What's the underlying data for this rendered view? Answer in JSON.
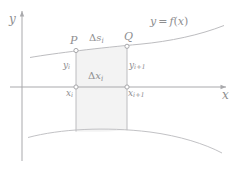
{
  "figure": {
    "background_color": "#ffffff",
    "line_color": "#b9b9bc",
    "axis_color": "#a8a8ab",
    "text_color": "#8e8e90",
    "fill_color": "#f2f2f2"
  },
  "axes": {
    "y_label": "y",
    "x_label": "x",
    "x_axis_y": 87,
    "y_axis_x": 22,
    "x_axis_start": 10,
    "x_axis_end": 228,
    "y_axis_start": 10,
    "y_axis_end": 161
  },
  "curve": {
    "function_label": "y = f(x)",
    "type": "increasing-concave-up"
  },
  "lower_curve": {
    "type": "arc-concave-down"
  },
  "points": [
    {
      "name": "P",
      "label": "P",
      "x": 76,
      "y": 50
    },
    {
      "name": "Q",
      "label": "Q",
      "x": 127,
      "y": 46
    },
    {
      "name": "x_i-axis-point",
      "label": "",
      "x": 76,
      "y": 87
    },
    {
      "name": "x_i+1-axis-point",
      "label": "",
      "x": 127,
      "y": 87
    }
  ],
  "labels": {
    "point_p": "P",
    "point_q": "Q",
    "arc_length": {
      "delta": "Δ",
      "base": "s",
      "subscript": "i"
    },
    "delta_x": {
      "delta": "Δ",
      "base": "x",
      "subscript": "i"
    },
    "y_i": {
      "base": "y",
      "subscript": "i"
    },
    "y_i_plus_1": {
      "base": "y",
      "subscript": "i+1"
    },
    "x_i": {
      "base": "x",
      "subscript": "i"
    },
    "x_i_plus_1": {
      "base": "x",
      "subscript": "i+1"
    },
    "function": {
      "lhs": "y",
      "eq": "=",
      "fn": "f",
      "open": "(",
      "arg": "x",
      "close": ")"
    }
  },
  "region": {
    "name": "shaded-strip",
    "left": 76,
    "right": 127,
    "top": 50,
    "bottom": 131
  }
}
